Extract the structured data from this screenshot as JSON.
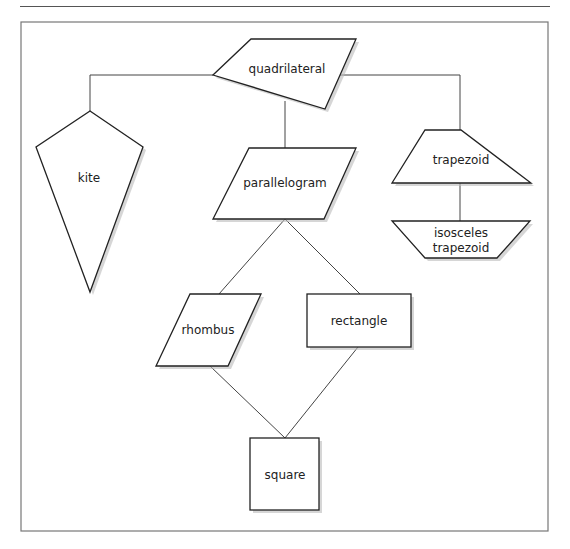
{
  "diagram": {
    "type": "hierarchy",
    "nodes": {
      "quadrilateral": {
        "label": "quadrilateral",
        "shape": "irregular-quadrilateral"
      },
      "kite": {
        "label": "kite",
        "shape": "kite"
      },
      "parallelogram": {
        "label": "parallelogram",
        "shape": "parallelogram"
      },
      "trapezoid": {
        "label": "trapezoid",
        "shape": "trapezoid"
      },
      "isosceles_trapezoid": {
        "label_line1": "isosceles",
        "label_line2": "trapezoid",
        "shape": "inverted-trapezoid"
      },
      "rhombus": {
        "label": "rhombus",
        "shape": "rhombus"
      },
      "rectangle": {
        "label": "rectangle",
        "shape": "rectangle"
      },
      "square": {
        "label": "square",
        "shape": "square"
      }
    },
    "edges": [
      [
        "quadrilateral",
        "kite"
      ],
      [
        "quadrilateral",
        "parallelogram"
      ],
      [
        "quadrilateral",
        "trapezoid"
      ],
      [
        "trapezoid",
        "isosceles_trapezoid"
      ],
      [
        "parallelogram",
        "rhombus"
      ],
      [
        "parallelogram",
        "rectangle"
      ],
      [
        "rhombus",
        "square"
      ],
      [
        "rectangle",
        "square"
      ]
    ]
  }
}
